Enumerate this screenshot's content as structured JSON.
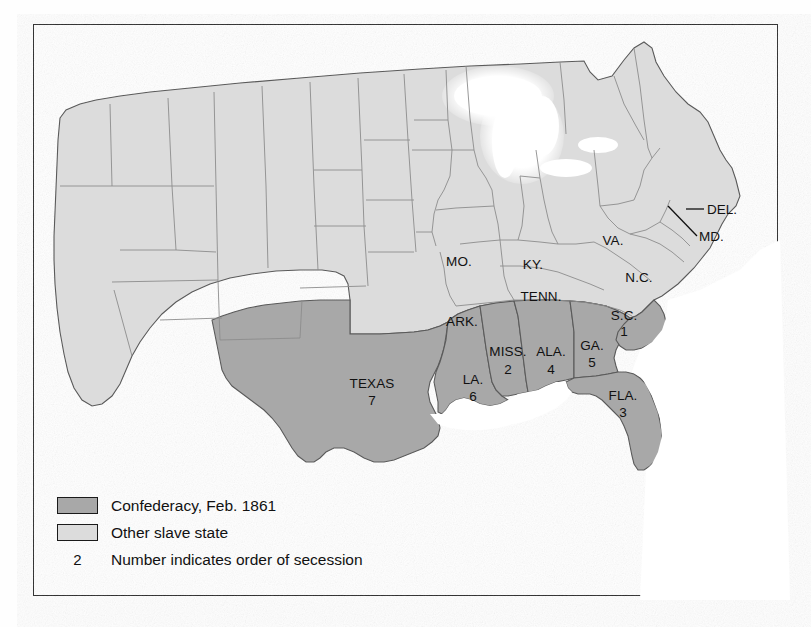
{
  "figure": {
    "kind": "historical-thematic-map"
  },
  "map": {
    "confederate_states": [
      {
        "id": "SC",
        "label": "S.C.",
        "number": "1",
        "x": 624,
        "y": 316
      },
      {
        "id": "MS",
        "label": "MISS.",
        "number": "2",
        "x": 508,
        "y": 355
      },
      {
        "id": "FL",
        "label": "FLA.",
        "number": "3",
        "x": 623,
        "y": 396
      },
      {
        "id": "AL",
        "label": "ALA.",
        "number": "4",
        "x": 551,
        "y": 355
      },
      {
        "id": "GA",
        "label": "GA.",
        "number": "5",
        "x": 592,
        "y": 349
      },
      {
        "id": "LA",
        "label": "LA.",
        "number": "6",
        "x": 473,
        "y": 383
      },
      {
        "id": "TX",
        "label": "TEXAS",
        "number": "7",
        "x": 372,
        "y": 386
      }
    ],
    "other_slave_states": [
      {
        "id": "MO",
        "label": "MO.",
        "x": 459,
        "y": 265
      },
      {
        "id": "AR",
        "label": "ARK.",
        "x": 462,
        "y": 325
      },
      {
        "id": "KY",
        "label": "KY.",
        "x": 533,
        "y": 268
      },
      {
        "id": "TN",
        "label": "TENN.",
        "x": 541,
        "y": 300
      },
      {
        "id": "VA",
        "label": "VA.",
        "x": 613,
        "y": 244
      },
      {
        "id": "NC",
        "label": "N.C.",
        "x": 639,
        "y": 281
      },
      {
        "id": "DE",
        "label": "DEL.",
        "x": 708,
        "y": 213,
        "callout": true
      },
      {
        "id": "MD",
        "label": "MD.",
        "x": 700,
        "y": 240,
        "callout": true
      }
    ],
    "colors": {
      "confederacy": "#a8a8a8",
      "other_slave_state": "#dcdcdc",
      "free_state": "#dcdcdc",
      "water": "#ffffff",
      "border_line": "#6f6f6f",
      "outline": "#5a5a5a",
      "frame": "#2b2b2b",
      "text": "#111111"
    }
  },
  "legend": {
    "rows": [
      {
        "key": "swatch-confederacy",
        "text": "Confederacy, Feb. 1861"
      },
      {
        "key": "swatch-other",
        "text": "Other slave state"
      },
      {
        "key": "number-2",
        "number": "2",
        "text": "Number indicates order of secession"
      }
    ]
  }
}
